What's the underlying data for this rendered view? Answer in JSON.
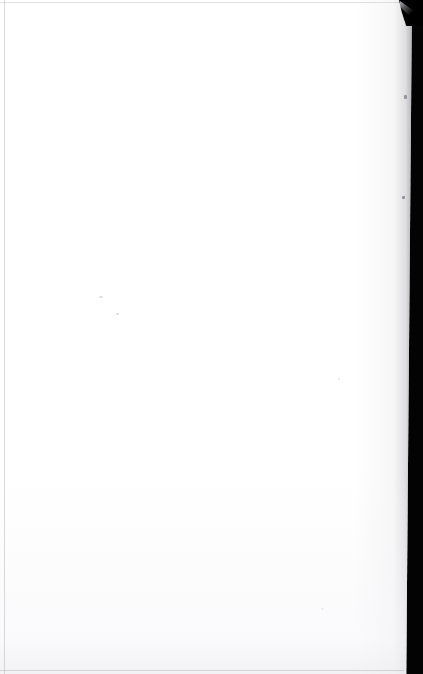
{
  "document": {
    "page_content": "",
    "page_text": "",
    "visible_text_count": 0,
    "description_label": "",
    "page_state": ""
  },
  "canvas": {
    "width": 423,
    "height": 674
  },
  "colors": {
    "paper": "#ffffff",
    "scanner_background": "#030303",
    "edge_line": "#a8a8ae",
    "page_shadow": "#c4c4c8",
    "speck": "#d8d8dc",
    "corner_curl": "#000000"
  },
  "regions": {
    "paper_label": "",
    "scanner_bed_label": "",
    "corner_curl_label": "",
    "left_edge_label": "",
    "top_edge_label": "",
    "bottom_edge_label": ""
  },
  "artifacts": {
    "specks": [
      "",
      "",
      "",
      "",
      "",
      ""
    ]
  }
}
